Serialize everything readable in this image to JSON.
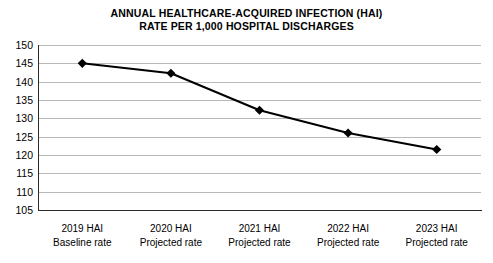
{
  "chart_data": {
    "type": "line",
    "title": "ANNUAL HEALTHCARE-ACQUIRED INFECTION (HAI) RATE PER 1,000 HOSPITAL DISCHARGES",
    "title_line1": "ANNUAL HEALTHCARE-ACQUIRED INFECTION (HAI)",
    "title_line2": "RATE PER 1,000 HOSPITAL DISCHARGES",
    "xlabel": "",
    "ylabel": "",
    "categories": [
      "2019 HAI Baseline rate",
      "2020 HAI Projected rate",
      "2021 HAI Projected rate",
      "2022 HAI Projected rate",
      "2023 HAI Projected rate"
    ],
    "category_lines": [
      {
        "line1": "2019 HAI",
        "line2": "Baseline rate"
      },
      {
        "line1": "2020 HAI",
        "line2": "Projected rate"
      },
      {
        "line1": "2021 HAI",
        "line2": "Projected rate"
      },
      {
        "line1": "2022 HAI",
        "line2": "Projected rate"
      },
      {
        "line1": "2023 HAI",
        "line2": "Projected rate"
      }
    ],
    "values": [
      145,
      142.3,
      132.2,
      126,
      121.5
    ],
    "ylim": [
      105,
      150
    ],
    "ytick_step": 5,
    "ytick_labels": [
      "150",
      "145",
      "140",
      "135",
      "130",
      "125",
      "120",
      "115",
      "110",
      "105"
    ],
    "ytick_values": [
      150,
      145,
      140,
      135,
      130,
      125,
      120,
      115,
      110,
      105
    ],
    "grid": true,
    "grid_axis": "y",
    "legend": false,
    "legend_position": "none",
    "marker": "diamond",
    "line_color": "#000000",
    "marker_color": "#000000",
    "grid_color": "#b9b9b9",
    "axis_color": "#2b2b2b",
    "background_color": "#ffffff"
  }
}
